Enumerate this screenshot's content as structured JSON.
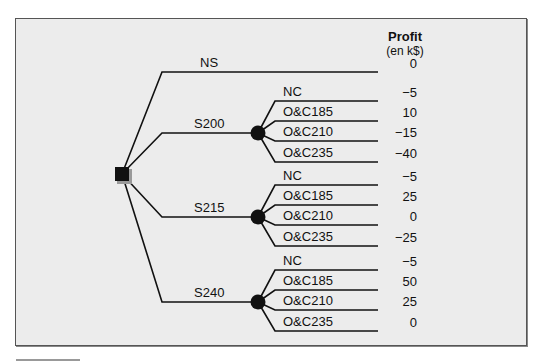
{
  "header": {
    "title": "Profit",
    "unit": "(en k$)"
  },
  "decision_node": {
    "type": "decision",
    "shape": "square"
  },
  "branches": [
    {
      "label": "NS",
      "node": "terminal",
      "profit": "0"
    },
    {
      "label": "S200",
      "node": "chance",
      "outcomes": [
        {
          "label": "NC",
          "profit": "−5"
        },
        {
          "label": "O&C185",
          "profit": "10"
        },
        {
          "label": "O&C210",
          "profit": "−15"
        },
        {
          "label": "O&C235",
          "profit": "−40"
        }
      ]
    },
    {
      "label": "S215",
      "node": "chance",
      "outcomes": [
        {
          "label": "NC",
          "profit": "−5"
        },
        {
          "label": "O&C185",
          "profit": "25"
        },
        {
          "label": "O&C210",
          "profit": "0"
        },
        {
          "label": "O&C235",
          "profit": "−25"
        }
      ]
    },
    {
      "label": "S240",
      "node": "chance",
      "outcomes": [
        {
          "label": "NC",
          "profit": "−5"
        },
        {
          "label": "O&C185",
          "profit": "50"
        },
        {
          "label": "O&C210",
          "profit": "25"
        },
        {
          "label": "O&C235",
          "profit": "0"
        }
      ]
    }
  ],
  "colors": {
    "background": "#ececec",
    "line": "#111111"
  }
}
